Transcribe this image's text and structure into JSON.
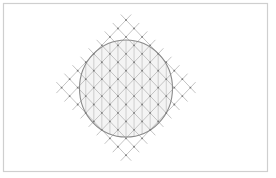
{
  "figure": {
    "width": 276,
    "height": 178,
    "background": "#ffffff",
    "frame": {
      "x": 3.5,
      "y": 3.5,
      "width": 264,
      "height": 168,
      "stroke": "#cfcfcf",
      "stroke_width": 1.2
    },
    "lattice": {
      "description": "Diamond-shaped diagonal grid of 9 x 9 intersection points",
      "divisions": 8,
      "top_vertex": [
        126,
        20
      ],
      "half_step_x": 8.05,
      "half_step_y": 8.45,
      "overshoot": 0.65,
      "line_color": "#bdbdbd",
      "line_width": 0.9,
      "node_color": "#7a7a7a",
      "node_radius": 0.9
    },
    "circle": {
      "cx": 126,
      "cy": 88.5,
      "rx": 46.5,
      "ry": 48.5,
      "stroke": "#8a8a8a",
      "stroke_width": 1.1,
      "fill": "#f4f4f4"
    },
    "verticals": {
      "description": "Vertical lines through lattice columns, clipped to the circle",
      "color": "#c4c4c4",
      "width": 0.8
    }
  }
}
